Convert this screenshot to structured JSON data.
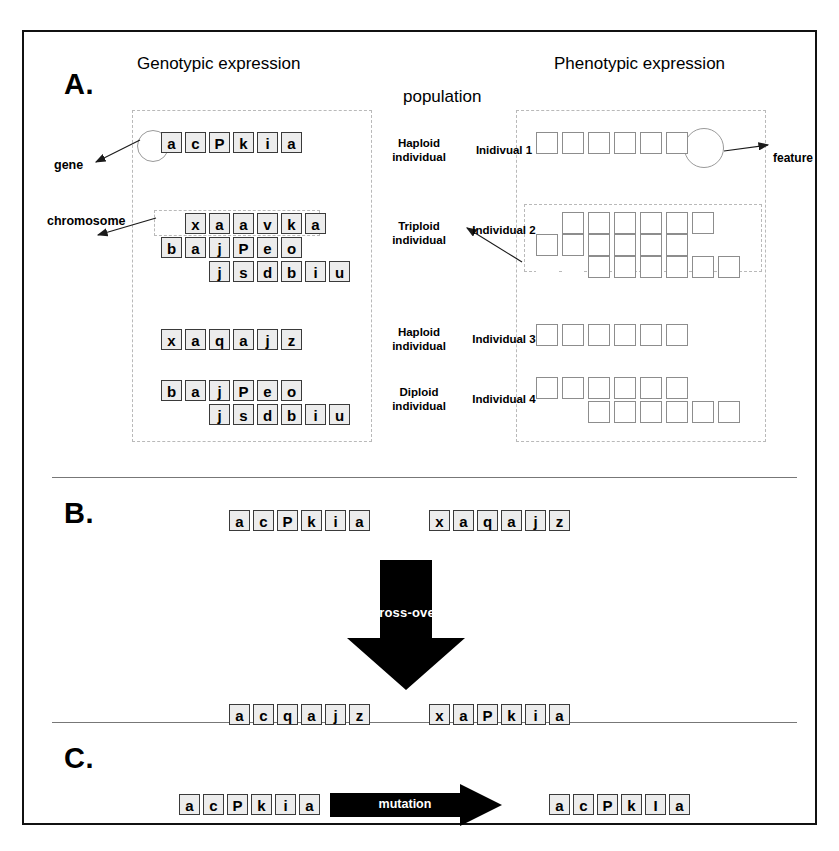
{
  "figure": {
    "panels": [
      {
        "letter": "A."
      },
      {
        "letter": "B."
      },
      {
        "letter": "C."
      }
    ],
    "headings": {
      "genotypic": "Genotypic expression",
      "phenotypic": "Phenotypic expression",
      "population": "population"
    },
    "annotations": {
      "gene": "gene",
      "chromosome": "chromosome",
      "feature": "feature"
    }
  },
  "panel_a": {
    "rows": [
      {
        "ploidy": "Haploid individual",
        "ploidy_line1": "Haploid",
        "ploidy_line2": "individual",
        "individual": "Inidivual 1",
        "genotype": [
          {
            "offset": 0,
            "genes": [
              "a",
              "c",
              "P",
              "k",
              "i",
              "a"
            ]
          }
        ],
        "phenotype": [
          {
            "offset": 0,
            "count": 6
          }
        ]
      },
      {
        "ploidy": "Triploid individual",
        "ploidy_line1": "Triploid",
        "ploidy_line2": "individual",
        "individual": "Individual 2",
        "genotype": [
          {
            "offset": 1,
            "genes": [
              "x",
              "a",
              "a",
              "v",
              "k",
              "a"
            ]
          },
          {
            "offset": 0,
            "genes": [
              "b",
              "a",
              "j",
              "P",
              "e",
              "o"
            ]
          },
          {
            "offset": 2,
            "genes": [
              "j",
              "s",
              "d",
              "b",
              "i",
              "u"
            ]
          }
        ],
        "phenotype": [
          {
            "offset": 1,
            "count": 6
          },
          {
            "offset": 0,
            "count": 6
          },
          {
            "offset": 2,
            "count": 6
          }
        ]
      },
      {
        "ploidy": "Haploid individual",
        "ploidy_line1": "Haploid",
        "ploidy_line2": "individual",
        "individual": "Individual 3",
        "genotype": [
          {
            "offset": 0,
            "genes": [
              "x",
              "a",
              "q",
              "a",
              "j",
              "z"
            ]
          }
        ],
        "phenotype": [
          {
            "offset": 0,
            "count": 6
          }
        ]
      },
      {
        "ploidy": "Diploid individual",
        "ploidy_line1": "Diploid",
        "ploidy_line2": "individual",
        "individual": "Individual 4",
        "genotype": [
          {
            "offset": 0,
            "genes": [
              "b",
              "a",
              "j",
              "P",
              "e",
              "o"
            ]
          },
          {
            "offset": 2,
            "genes": [
              "j",
              "s",
              "d",
              "b",
              "i",
              "u"
            ]
          }
        ],
        "phenotype": [
          {
            "offset": 0,
            "count": 6
          },
          {
            "offset": 2,
            "count": 6
          }
        ]
      }
    ]
  },
  "panel_b": {
    "process_label": "cross-over",
    "before": [
      {
        "genes": [
          "a",
          "c",
          "P",
          "k",
          "i",
          "a"
        ]
      },
      {
        "genes": [
          "x",
          "a",
          "q",
          "a",
          "j",
          "z"
        ]
      }
    ],
    "after": [
      {
        "genes": [
          "a",
          "c",
          "q",
          "a",
          "j",
          "z"
        ]
      },
      {
        "genes": [
          "x",
          "a",
          "P",
          "k",
          "i",
          "a"
        ]
      }
    ]
  },
  "panel_c": {
    "process_label": "mutation",
    "before": {
      "genes": [
        "a",
        "c",
        "P",
        "k",
        "i",
        "a"
      ]
    },
    "after": {
      "genes": [
        "a",
        "c",
        "P",
        "k",
        "I",
        "a"
      ]
    }
  },
  "colors": {
    "frame": "#111111",
    "tile_fill": "#ececec",
    "tile_border": "#3a3a3a",
    "square_border": "#8d8d8d",
    "dashed": "#b9b9b9",
    "arrow": "#000000"
  }
}
